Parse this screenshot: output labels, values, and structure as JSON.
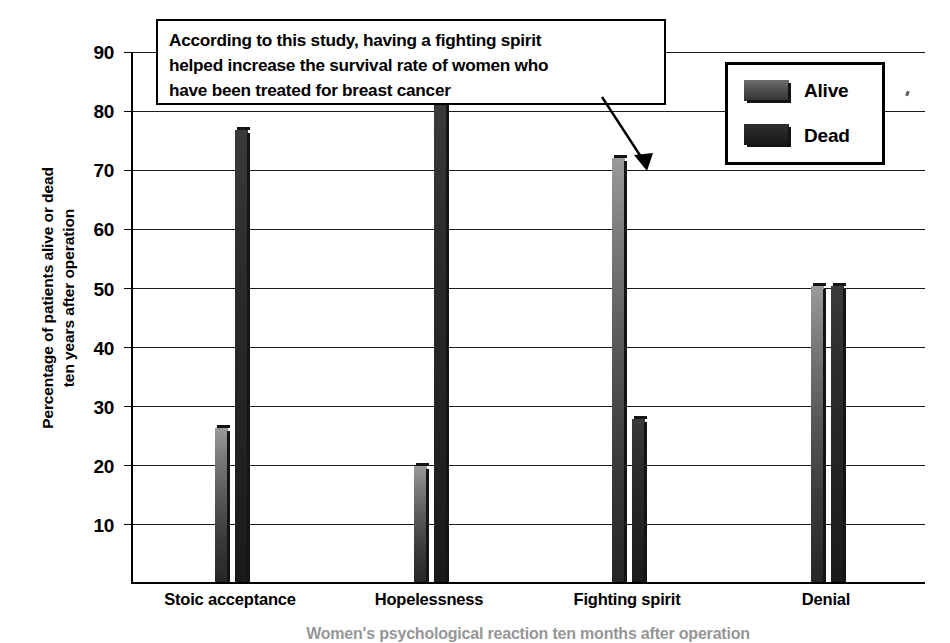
{
  "chart_data": {
    "type": "bar",
    "title": "",
    "xlabel": "Women's psychological reaction ten months after operation",
    "ylabel": "Percentage of patients alive or dead ten years after operation",
    "ylabel_lines": [
      "Percentage of patients alive or dead",
      "ten years after operation"
    ],
    "categories": [
      "Stoic acceptance",
      "Hopelessness",
      "Fighting spirit",
      "Denial"
    ],
    "series": [
      {
        "name": "Alive",
        "values": [
          26,
          19.7,
          71.8,
          50
        ],
        "color": "#585858"
      },
      {
        "name": "Dead",
        "values": [
          76.5,
          81.5,
          27.5,
          50
        ],
        "color": "#1f1f1f"
      }
    ],
    "ylim": [
      0,
      90
    ],
    "yticks": [
      10,
      20,
      30,
      40,
      50,
      60,
      70,
      80,
      90
    ],
    "ytick_labels": [
      "10",
      "20",
      "30",
      "40",
      "50",
      "60",
      "70",
      "80",
      "90"
    ],
    "grid": true,
    "legend_position": "top-right",
    "annotations": [
      {
        "name": "study-callout",
        "text": "According to this study, having a fighting spirit helped increase the survival rate of women who have been treated for breast cancer",
        "lines": [
          "According to this study, having a fighting spirit",
          "helped increase the survival rate of women who",
          "have been treated for breast cancer"
        ],
        "points_to": "Fighting spirit / Alive"
      }
    ]
  },
  "legend": {
    "items": [
      {
        "label": "Alive"
      },
      {
        "label": "Dead"
      }
    ]
  },
  "icons": {
    "callout_arrow": "arrow-down-right-icon"
  }
}
